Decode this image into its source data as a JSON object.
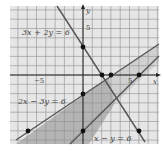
{
  "diagram": {
    "type": "linear-inequalities-graph",
    "axes": {
      "x_label": "x",
      "y_label": "y",
      "x_tick_labels": [
        {
          "value": -5,
          "text": "−5"
        },
        {
          "value": 5,
          "text": "5"
        }
      ],
      "y_tick_labels": [
        {
          "value": 5,
          "text": "5"
        }
      ],
      "x_range": [
        -8,
        8
      ],
      "y_range": [
        -7,
        7.5
      ],
      "grid": true
    },
    "lines": [
      {
        "equation": "3x + 2y = 6",
        "label": "3x + 2y = 6"
      },
      {
        "equation": "2x − 3y = 6",
        "label": "2x − 3y = 6"
      },
      {
        "equation": "x − y = 6",
        "label": "x − y = 6"
      }
    ],
    "points": [
      {
        "x": 0,
        "y": 3
      },
      {
        "x": 2,
        "y": 0
      },
      {
        "x": 3,
        "y": 0
      },
      {
        "x": 6,
        "y": 0
      },
      {
        "x": 0,
        "y": -2
      },
      {
        "x": 0,
        "y": -6
      },
      {
        "x": -6,
        "y": -6
      },
      {
        "x": 6,
        "y": -6
      }
    ],
    "colors": {
      "background_shade": "#e6e6e6",
      "strip_shade": "#d4d4d4",
      "region_shade": "#b8b8b8",
      "grid": "#8a8a8a",
      "line": "#555555",
      "point": "#111111"
    }
  }
}
